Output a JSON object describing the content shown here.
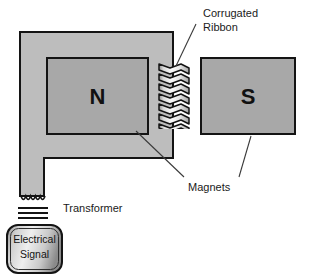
{
  "diagram": {
    "background_color": "#ffffff",
    "colors": {
      "yoke_fill": "#bdbdbd",
      "magnet_fill": "#a8a8a8",
      "ribbon_light": "#f2f2f2",
      "ribbon_dark": "#9a9a9a",
      "signal_box_light": "#e8e8e8",
      "signal_box_dark": "#8e8e8e",
      "outline": "#141414",
      "leader_line": "#3a3a3a",
      "text": "#1a1a1a"
    },
    "parts": {
      "north_magnet": {
        "name": "North magnet",
        "pole_label": "N"
      },
      "south_magnet": {
        "name": "South magnet",
        "pole_label": "S"
      },
      "yoke": {
        "name": "Magnetic yoke / frame"
      },
      "ribbon": {
        "name": "Corrugated ribbon element",
        "fold_count": 6
      },
      "transformer_core": {
        "name": "Transformer core plates",
        "plate_count": 3
      },
      "coil": {
        "name": "Transformer coil winding",
        "turn_count": 5
      }
    },
    "labels": {
      "corrugated_ribbon_line1": "Corrugated",
      "corrugated_ribbon_line2": "Ribbon",
      "magnets": "Magnets",
      "transformer": "Transformer",
      "signal_line1": "Electrical",
      "signal_line2": "Signal"
    }
  }
}
